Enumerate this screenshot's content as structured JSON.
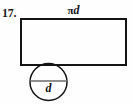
{
  "figure": {
    "problem_number": "17.",
    "top_label": {
      "full_text": "πd",
      "constant": "π",
      "variable": "d"
    },
    "diameter_label": "d",
    "colors": {
      "stroke": "#141414",
      "diameter_stroke": "#6a6a6a",
      "background": "#fefefe",
      "text": "#121212"
    },
    "geometry": {
      "rectangle": {
        "x": 21,
        "y": 19,
        "width": 105,
        "height": 46,
        "stroke_width": 1.6
      },
      "circle": {
        "cx": 48.5,
        "cy": 82,
        "r": 18.5,
        "stroke_width": 1.5
      },
      "diameter_line": {
        "x1": 30,
        "y1": 81,
        "x2": 67,
        "y2": 81,
        "stroke_width": 1.3
      }
    }
  }
}
